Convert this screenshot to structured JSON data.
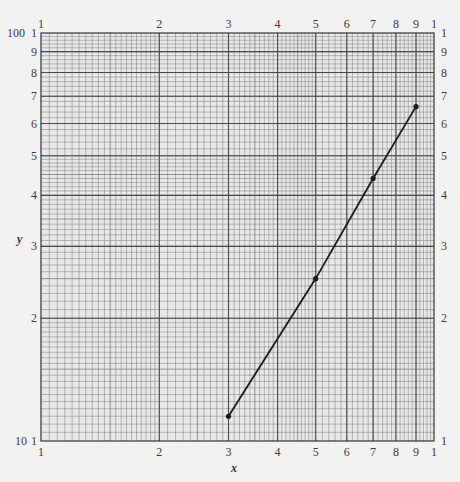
{
  "chart_data": {
    "type": "line",
    "title": "",
    "xlabel": "x",
    "ylabel": "y",
    "xscale": "log",
    "yscale": "log",
    "xlim": [
      1,
      10
    ],
    "ylim": [
      10,
      100
    ],
    "grid": true,
    "x_ticks_bottom": [
      "1",
      "2",
      "3",
      "4",
      "5",
      "6",
      "7",
      "8",
      "9",
      "1"
    ],
    "x_ticks_top": [
      "1",
      "2",
      "3",
      "4",
      "5",
      "6",
      "7",
      "8",
      "9",
      "1"
    ],
    "y_ticks_left": [
      "1",
      "2",
      "3",
      "4",
      "5",
      "6",
      "7",
      "8",
      "9",
      "1"
    ],
    "y_ticks_right": [
      "1",
      "2",
      "3",
      "4",
      "5",
      "6",
      "7",
      "8",
      "9",
      "1"
    ],
    "y_decade_labels": [
      "10",
      "100"
    ],
    "series": [
      {
        "name": "data",
        "x": [
          3,
          5,
          7,
          9
        ],
        "y": [
          11.5,
          25,
          44,
          66
        ],
        "markers": true
      }
    ]
  },
  "labels": {
    "x_axis": "x",
    "y_axis": "y",
    "y_min_decade": "10",
    "y_max_decade": "100"
  }
}
